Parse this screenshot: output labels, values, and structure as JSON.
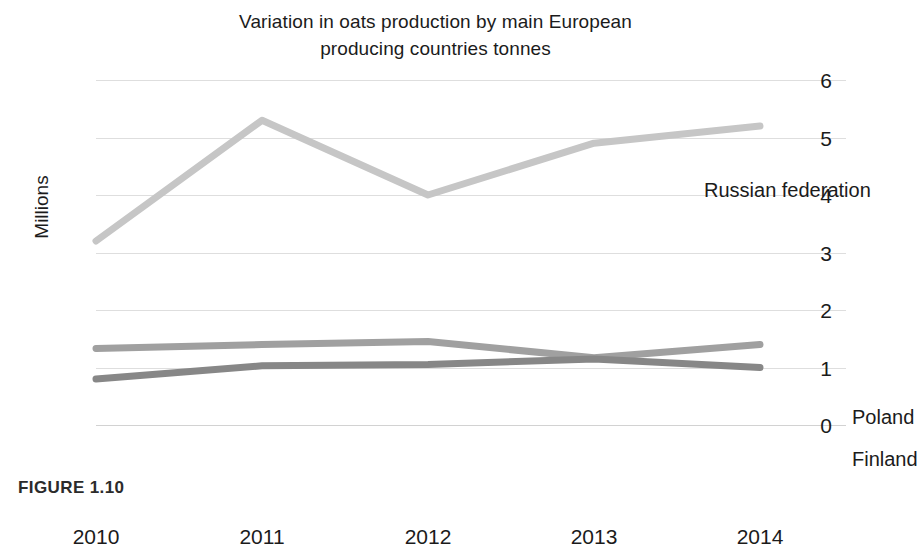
{
  "figure": {
    "caption": "FIGURE 1.10"
  },
  "chart_data": {
    "type": "line",
    "title": "Variation in oats production by main European producing countries tonnes",
    "title_lines": [
      "Variation in oats production by main European",
      "producing countries tonnes"
    ],
    "xlabel": "",
    "ylabel": "Millions",
    "categories": [
      "2010",
      "2011",
      "2012",
      "2013",
      "2014"
    ],
    "x": [
      2010,
      2011,
      2012,
      2013,
      2014
    ],
    "ylim": [
      0,
      6
    ],
    "y_ticks": [
      "6",
      "5",
      "4",
      "3",
      "2",
      "1",
      "0"
    ],
    "y_tick_values": [
      6,
      5,
      4,
      3,
      2,
      1,
      0
    ],
    "grid": true,
    "legend_position": "inline-right-of-line-end",
    "series": [
      {
        "name": "Russian federation",
        "color": "#c6c6c6",
        "values": [
          3.2,
          5.3,
          4.0,
          4.9,
          5.2
        ]
      },
      {
        "name": "Poland",
        "color": "#a0a0a0",
        "values": [
          1.33,
          1.4,
          1.45,
          1.17,
          1.4
        ]
      },
      {
        "name": "Finland",
        "color": "#878787",
        "values": [
          0.8,
          1.03,
          1.05,
          1.15,
          1.0
        ]
      }
    ]
  }
}
